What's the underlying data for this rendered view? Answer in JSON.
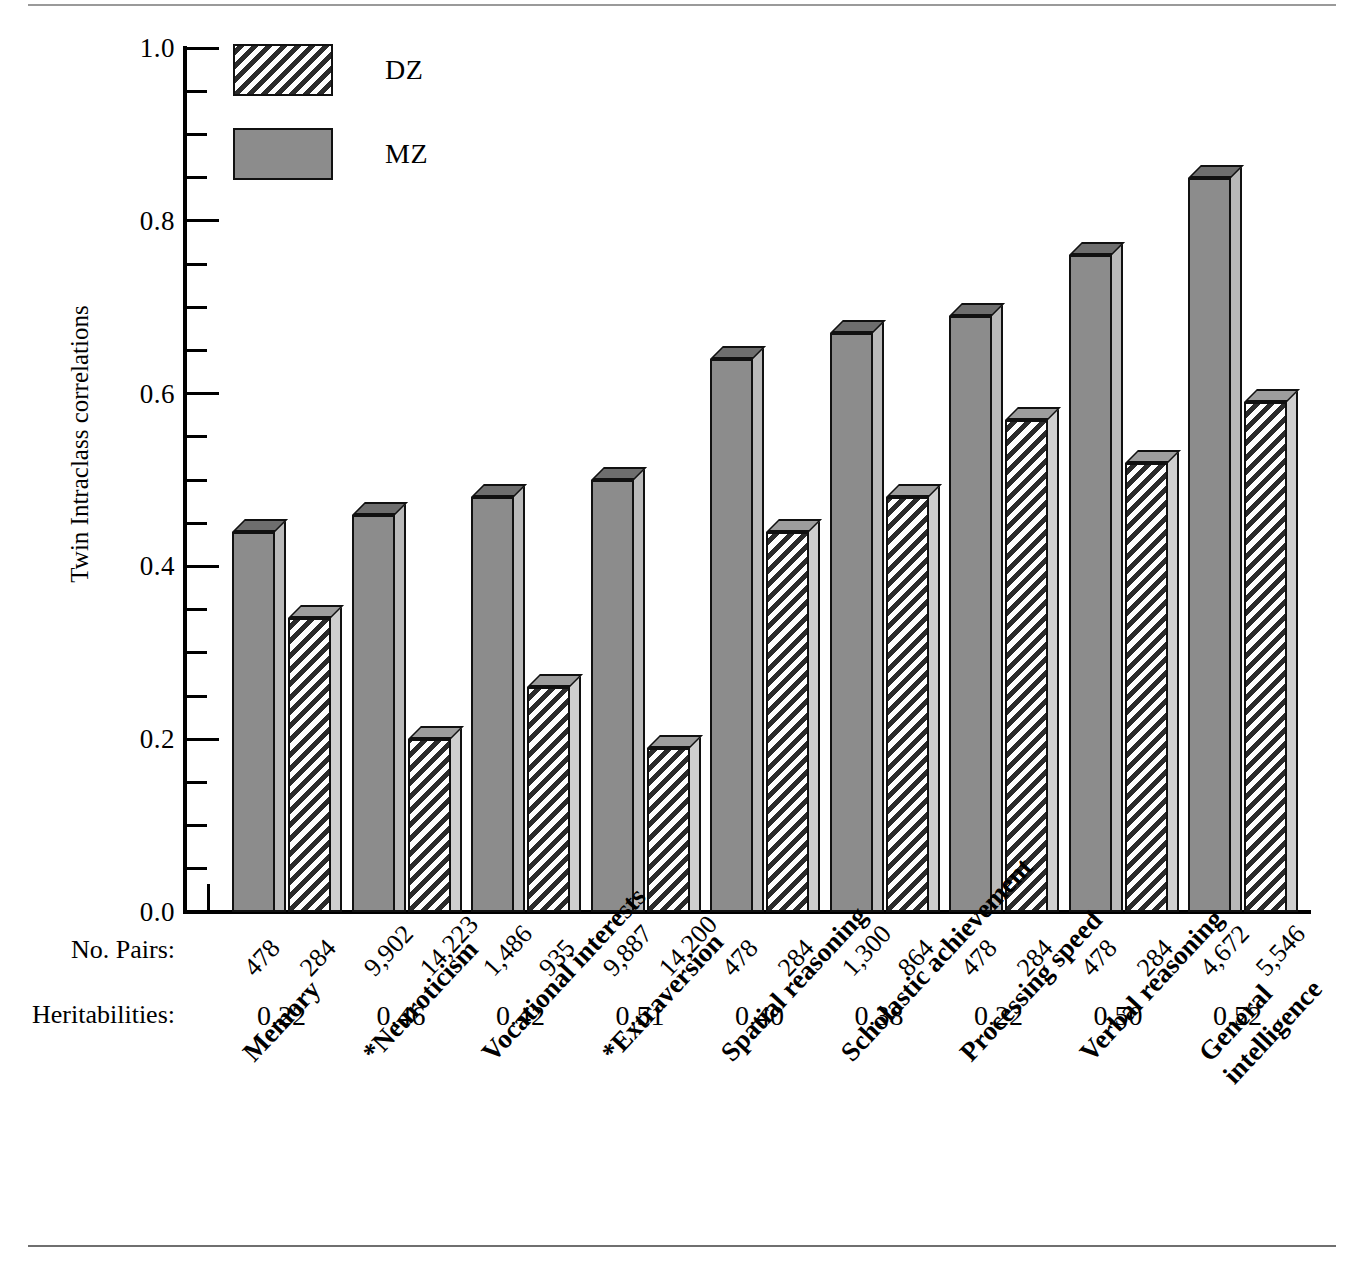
{
  "chart_data": {
    "type": "bar",
    "title": "",
    "xlabel": "",
    "ylabel": "Twin Intraclass correlations",
    "ylim": [
      0.0,
      1.0
    ],
    "ytick_labels": [
      "0.0",
      "0.2",
      "0.4",
      "0.6",
      "0.8",
      "1.0"
    ],
    "ytick_values": [
      0.0,
      0.2,
      0.4,
      0.6,
      0.8,
      1.0
    ],
    "minor_tick_step": 0.05,
    "grid": false,
    "legend_position": "top-left",
    "categories": [
      "Memory",
      "*Neuroticism",
      "Vocational interests",
      "*Extraversion",
      "Spatial reasoning",
      "Scholastic achievement",
      "Processing speed",
      "Verbal reasoning",
      "General intelligence"
    ],
    "category_lines": [
      [
        "Memory"
      ],
      [
        "*Neuroticism"
      ],
      [
        "Vocational interests"
      ],
      [
        "*Extraversion"
      ],
      [
        "Spatial reasoning"
      ],
      [
        "Scholastic achievement"
      ],
      [
        "Processing speed"
      ],
      [
        "Verbal reasoning"
      ],
      [
        "General",
        "intelligence"
      ]
    ],
    "series": [
      {
        "name": "MZ",
        "fill": "solid-gray",
        "order_in_group": 1,
        "values": [
          0.44,
          0.46,
          0.48,
          0.5,
          0.64,
          0.67,
          0.69,
          0.76,
          0.85
        ]
      },
      {
        "name": "DZ",
        "fill": "diagonal-hatch",
        "order_in_group": 2,
        "values": [
          0.34,
          0.2,
          0.26,
          0.19,
          0.44,
          0.48,
          0.57,
          0.52,
          0.59
        ]
      }
    ],
    "annotation_rows": [
      {
        "label": "No. Pairs:",
        "values_mz": [
          "478",
          "9,902",
          "1,486",
          "9,887",
          "478",
          "1,300",
          "478",
          "478",
          "4,672"
        ],
        "values_dz": [
          "284",
          "14,223",
          "935",
          "14,200",
          "284",
          "864",
          "284",
          "284",
          "5,546"
        ]
      },
      {
        "label": "Heritabilities:",
        "values": [
          "0.22",
          "0.46",
          "0.42",
          "0.51",
          "0.40",
          "0.38",
          "0.22",
          "0.50",
          "0.52"
        ]
      }
    ]
  },
  "legend": {
    "entries": [
      {
        "label": "DZ",
        "swatch": "diagonal-hatch"
      },
      {
        "label": "MZ",
        "swatch": "solid-gray"
      }
    ]
  },
  "axis": {
    "y_label": "Twin Intraclass correlations",
    "y_ticks": [
      "1.0",
      "0.8",
      "0.6",
      "0.4",
      "0.2",
      "0.0"
    ]
  },
  "rows": {
    "pairs_title": "No. Pairs:",
    "heritabilities_title": "Heritabilities:"
  },
  "colors": {
    "mz_fill": "#8c8c8c",
    "dz_fill": "#2b2b2b",
    "bar_outline": "#111111",
    "axis": "#000000",
    "background": "#ffffff",
    "rule": "#9a9a9a"
  }
}
